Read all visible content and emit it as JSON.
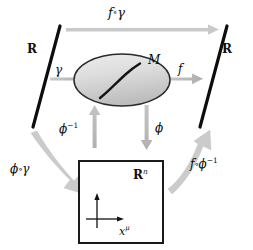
{
  "figure": {
    "kind": "commutative-diagram",
    "background_color": "#ffffff",
    "ink_color": "#0d0d0d",
    "arrow_color": "#b8b8b8",
    "arrow_color_dark": "#a3a3a3",
    "manifold_fill_top": "#e6e6e6",
    "manifold_fill_bottom": "#c2c2c2"
  },
  "objects": {
    "real_line_left": {
      "label": "R",
      "name": "real-line-left"
    },
    "real_line_right": {
      "label": "R",
      "name": "real-line-right"
    },
    "manifold": {
      "label": "M",
      "name": "manifold-M"
    },
    "coordinate_space": {
      "label_base": "R",
      "label_exponent": "n",
      "axis_label_base": "x",
      "axis_label_exponent": "μ"
    }
  },
  "arrows": {
    "f_compose_gamma": {
      "label_f": "f",
      "label_circ": "∘",
      "label_gamma": "γ",
      "full": "f ∘ γ",
      "direction": "left-to-right-top"
    },
    "gamma": {
      "label": "γ",
      "direction": "left-to-right"
    },
    "f": {
      "label": "f",
      "direction": "left-to-right"
    },
    "phi_inverse": {
      "label_base": "ϕ",
      "label_exponent": "−1",
      "full": "ϕ⁻¹",
      "direction": "up"
    },
    "phi": {
      "label": "ϕ",
      "direction": "down"
    },
    "phi_compose_gamma": {
      "label_phi": "ϕ",
      "label_circ": "∘",
      "label_gamma": "γ",
      "full": "ϕ ∘ γ",
      "direction": "curved-down-right"
    },
    "f_compose_phi_inverse": {
      "label_f": "f",
      "label_circ": "∘",
      "label_phi": "ϕ",
      "label_exponent": "−1",
      "full": "f ∘ ϕ⁻¹",
      "direction": "curved-up-right"
    }
  }
}
